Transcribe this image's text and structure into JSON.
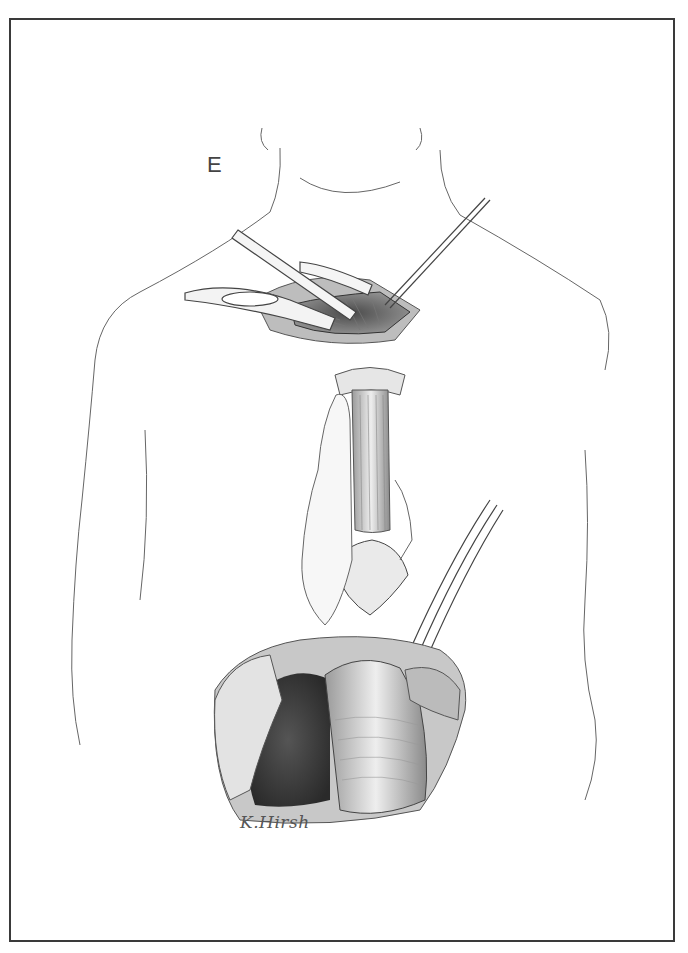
{
  "figure": {
    "panel_label": "E",
    "signature": "K.Hirsh",
    "colors": {
      "frame": "#3a3a3a",
      "line": "#555555",
      "shade_dark": "#3d3d3d",
      "shade_mid": "#8a8a8a",
      "shade_light": "#d8d8d8",
      "background": "#ffffff"
    }
  }
}
